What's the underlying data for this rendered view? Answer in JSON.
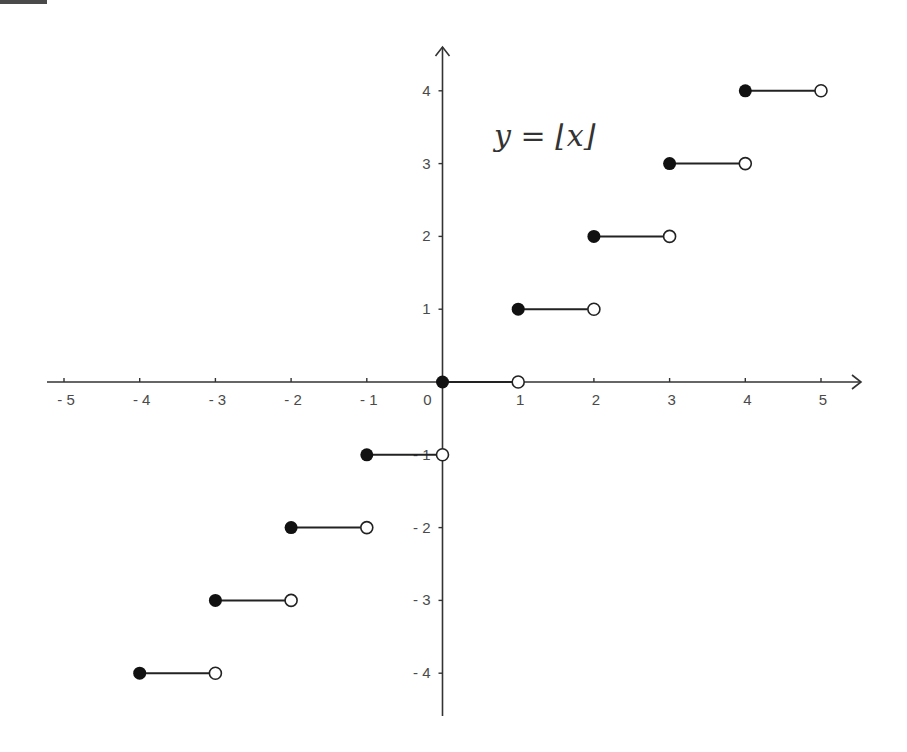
{
  "chart_data": {
    "type": "line",
    "title": "y = ⌊x⌋",
    "xlabel": "",
    "ylabel": "",
    "xlim": [
      -5.2,
      5.5
    ],
    "ylim": [
      -4.5,
      4.5
    ],
    "grid": false,
    "legend": null,
    "x_ticks": [
      -5,
      -4,
      -3,
      -2,
      -1,
      0,
      1,
      2,
      3,
      4,
      5
    ],
    "x_tick_labels": [
      "- 5",
      "- 4",
      "- 3",
      "- 2",
      "- 1",
      "0",
      "1",
      "2",
      "3",
      "4",
      "5"
    ],
    "y_ticks": [
      -4,
      -3,
      -2,
      -1,
      1,
      2,
      3,
      4
    ],
    "y_tick_labels": [
      "- 4",
      "- 3",
      "- 2",
      "- 1",
      "1",
      "2",
      "3",
      "4"
    ],
    "series": [
      {
        "name": "floor(x)",
        "style": "step segments, filled dot at left endpoint (included), open dot at right endpoint (excluded)",
        "segments": [
          {
            "x_start": -4,
            "x_end": -3,
            "y": -4
          },
          {
            "x_start": -3,
            "x_end": -2,
            "y": -3
          },
          {
            "x_start": -2,
            "x_end": -1,
            "y": -2
          },
          {
            "x_start": -1,
            "x_end": 0,
            "y": -1
          },
          {
            "x_start": 0,
            "x_end": 1,
            "y": 0
          },
          {
            "x_start": 1,
            "x_end": 2,
            "y": 1
          },
          {
            "x_start": 2,
            "x_end": 3,
            "y": 2
          },
          {
            "x_start": 3,
            "x_end": 4,
            "y": 3
          },
          {
            "x_start": 4,
            "x_end": 5,
            "y": 4
          }
        ]
      }
    ],
    "annotations": [
      {
        "text": "y = ⌊x⌋",
        "x": 1.3,
        "y": 3.4
      }
    ]
  },
  "colors": {
    "axis": "#333333",
    "segment": "#222222",
    "filled_dot": "#111111",
    "open_dot_fill": "#ffffff",
    "label": "#4a4a4a"
  }
}
